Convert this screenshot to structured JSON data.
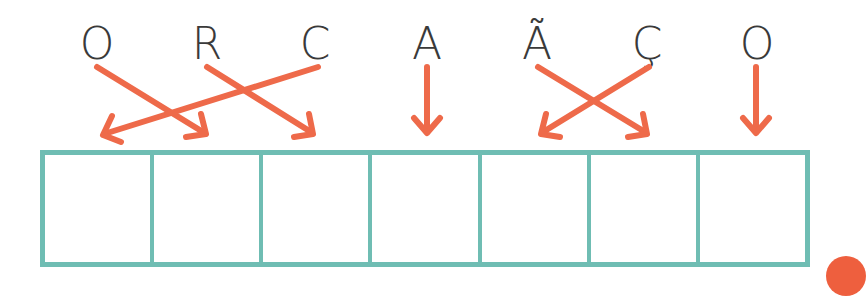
{
  "exercise": {
    "letters": [
      "O",
      "R",
      "C",
      "A",
      "Ã",
      "Ç",
      "O"
    ],
    "target_word_slots": 7,
    "arrows": [
      {
        "from": "O",
        "from_index": 0,
        "to_slot": 1
      },
      {
        "from": "R",
        "from_index": 1,
        "to_slot": 2
      },
      {
        "from": "C",
        "from_index": 2,
        "to_slot": 0
      },
      {
        "from": "A",
        "from_index": 3,
        "to_slot": 3
      },
      {
        "from": "Ã",
        "from_index": 4,
        "to_slot": 5
      },
      {
        "from": "Ç",
        "from_index": 5,
        "to_slot": 4
      },
      {
        "from": "O",
        "from_index": 6,
        "to_slot": 6
      }
    ],
    "colors": {
      "arrow": "#ee6a4a",
      "grid": "#6fbdb3",
      "letter": "#3a3a3a"
    }
  }
}
